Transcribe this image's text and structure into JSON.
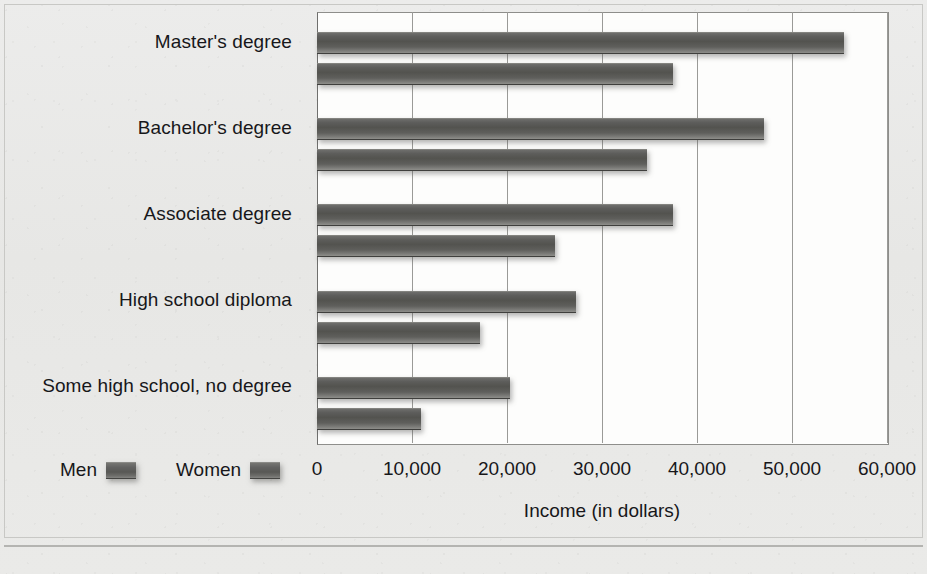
{
  "chart_data": {
    "type": "bar",
    "orientation": "horizontal",
    "title": "",
    "xlabel": "Income (in dollars)",
    "ylabel": "",
    "xlim": [
      0,
      60000
    ],
    "xticks": [
      "0",
      "10,000",
      "20,000",
      "30,000",
      "40,000",
      "50,000",
      "60,000"
    ],
    "xtick_values": [
      0,
      10000,
      20000,
      30000,
      40000,
      50000,
      60000
    ],
    "grid": true,
    "legend_position": "bottom-left",
    "categories": [
      "Master's degree",
      "Bachelor's degree",
      "Associate degree",
      "High school diploma",
      "Some high school, no degree"
    ],
    "series": [
      {
        "name": "Men",
        "values": [
          55500,
          47000,
          37500,
          27300,
          20300
        ]
      },
      {
        "name": "Women",
        "values": [
          37500,
          34700,
          25000,
          17200,
          10900
        ]
      }
    ]
  },
  "legend": {
    "items": [
      {
        "label": "Men"
      },
      {
        "label": "Women"
      }
    ]
  },
  "axis": {
    "x_title": "Income (in dollars)"
  },
  "colors": {
    "bar_fill": "#5d5d5b",
    "plot_background": "#fdfdfc",
    "page_background": "#e9e9e7",
    "gridline": "#9a9a97",
    "text": "#17171a"
  }
}
